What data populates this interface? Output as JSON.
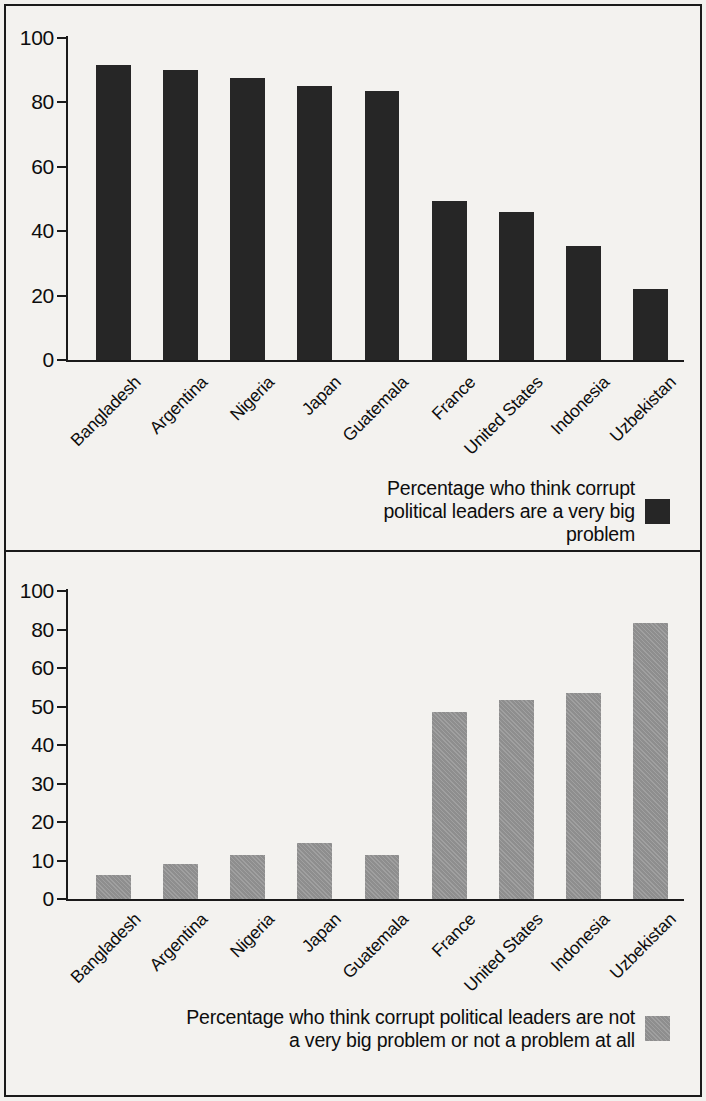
{
  "chart_data": [
    {
      "type": "bar",
      "id": "top",
      "title": "",
      "xlabel": "",
      "ylabel": "",
      "ylim": [
        0,
        100
      ],
      "ytick_labels": [
        "100",
        "80",
        "60",
        "40",
        "20",
        "0"
      ],
      "yticks": [
        100,
        80,
        60,
        40,
        20,
        0
      ],
      "tick_spacing": "linear",
      "grid": false,
      "legend_position": "below-right",
      "legend": "Percentage who think corrupt\npolitical leaders are a very big problem",
      "series_color": "#262626",
      "categories": [
        "Bangladesh",
        "Argentina",
        "Nigeria",
        "Japan",
        "Guatemala",
        "France",
        "United States",
        "Indonesia",
        "Uzbekistan"
      ],
      "values": [
        91.5,
        90,
        87.5,
        85,
        83.5,
        49.5,
        46,
        35.5,
        22
      ]
    },
    {
      "type": "bar",
      "id": "bottom",
      "title": "",
      "xlabel": "",
      "ylabel": "",
      "ylim": [
        0,
        100
      ],
      "ytick_labels": [
        "100",
        "80",
        "60",
        "50",
        "40",
        "30",
        "20",
        "10",
        "0"
      ],
      "yticks": [
        100,
        80,
        60,
        50,
        40,
        30,
        20,
        10,
        0
      ],
      "tick_spacing": "nonlinear-equal-spaced",
      "grid": false,
      "legend_position": "below-right",
      "legend": "Percentage who think corrupt political leaders are not\na very big problem or not a problem at all",
      "series_color": "#8e8e8e",
      "categories": [
        "Bangladesh",
        "Argentina",
        "Nigeria",
        "Japan",
        "Guatemala",
        "France",
        "United States",
        "Indonesia",
        "Uzbekistan"
      ],
      "values": [
        6.3,
        9,
        11.5,
        14.5,
        11.5,
        48.5,
        51.8,
        53.5,
        83.5
      ]
    }
  ]
}
